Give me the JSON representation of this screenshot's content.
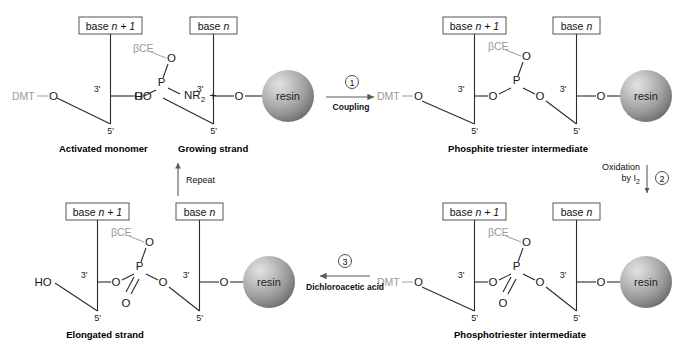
{
  "figure": {
    "type": "chemical-reaction-scheme"
  },
  "labels": {
    "base_n_plus_1": "base n + 1",
    "base_n": "base n",
    "base_word": "base",
    "n_plus_1": "n + 1",
    "n": "n",
    "dmt": "DMT",
    "bce": "βCE",
    "resin": "resin",
    "oxygen": "O",
    "phosphorus": "P",
    "nr2_main": "NR",
    "nr2_sub": "2",
    "ho": "HO",
    "plus": "+",
    "three_prime": "3'",
    "five_prime": "5'"
  },
  "captions": {
    "activated_monomer": "Activated monomer",
    "growing_strand": "Growing strand",
    "phosphite_triester": "Phosphite triester intermediate",
    "phosphotriester": "Phosphotriester intermediate",
    "elongated_strand": "Elongated strand"
  },
  "steps": [
    {
      "number": "1",
      "label": "Coupling",
      "direction": "right"
    },
    {
      "number": "2",
      "label_line1": "Oxidation",
      "label_line2_main": "by I",
      "label_line2_sub": "2",
      "direction": "down"
    },
    {
      "number": "3",
      "label": "Dichloroacetic acid",
      "direction": "left"
    }
  ],
  "repeat_arrow": {
    "label": "Repeat",
    "direction": "up"
  },
  "colors": {
    "bond": "#2b2b2b",
    "gray_text": "#999999",
    "arrow": "#5a5a5a",
    "resin_light": "#d8d8d8",
    "resin_mid": "#9a9a9a",
    "resin_dark": "#6f6f6f",
    "box_border": "#555555",
    "background": "#ffffff"
  }
}
